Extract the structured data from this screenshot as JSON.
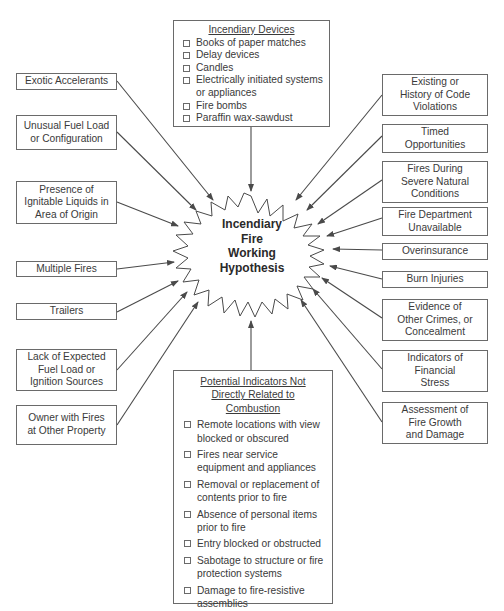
{
  "center": {
    "label": "Incendiary\nFire\nWorking\nHypothesis"
  },
  "top_box": {
    "title": "Incendiary Devices",
    "items": [
      "Books of paper matches",
      "Delay devices",
      "Candles",
      "Electrically initiated systems\nor appliances",
      "Fire bombs",
      "Paraffin wax-sawdust"
    ]
  },
  "bottom_box": {
    "title": "Potential Indicators Not\nDirectly Related to\nCombustion",
    "items": [
      "Remote locations with view\nblocked or obscured",
      "Fires near service\nequipment and appliances",
      "Removal or replacement of\ncontents prior to fire",
      "Absence of personal items\nprior to fire",
      "Entry blocked or obstructed",
      "Sabotage to structure or fire\nprotection systems",
      "Damage to fire-resistive\nassemblies"
    ]
  },
  "left_boxes": [
    "Exotic Accelerants",
    "Unusual Fuel Load\nor Configuration",
    "Presence of\nIgnitable Liquids in\nArea of Origin",
    "Multiple Fires",
    "Trailers",
    "Lack of Expected\nFuel Load or\nIgnition Sources",
    "Owner with Fires\nat Other Property"
  ],
  "right_boxes": [
    "Existing or\nHistory of Code\nViolations",
    "Timed\nOpportunities",
    "Fires During\nSevere Natural\nConditions",
    "Fire Department\nUnavailable",
    "Overinsurance",
    "Burn Injuries",
    "Evidence of\nOther Crimes, or\nConcealment",
    "Indicators of\nFinancial\nStress",
    "Assessment of\nFire Growth\nand Damage"
  ],
  "colors": {
    "line": "#4a4a4a",
    "border": "#6a6a6a",
    "text": "#3a3a3a"
  }
}
